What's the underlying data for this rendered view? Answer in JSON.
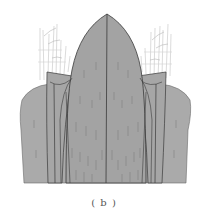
{
  "figure": {
    "caption": "( b )",
    "colors": {
      "background": "#ffffff",
      "body_fill": "#a9a9a9",
      "dome_fill": "#a4a4a4",
      "outline": "#3a3a3a",
      "vectors": "#7a7a7a",
      "wisps": "#c4c4c4"
    }
  }
}
